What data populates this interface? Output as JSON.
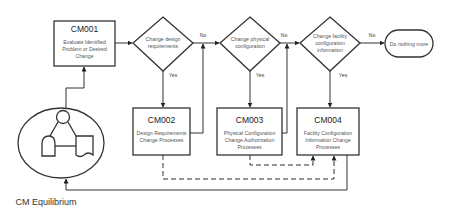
{
  "diagram": {
    "processes": [
      {
        "id": "cm001",
        "code": "CM001",
        "lines": [
          "Evaluate Identified",
          "Problem or Desired",
          "Change"
        ]
      },
      {
        "id": "cm002",
        "code": "CM002",
        "lines": [
          "Design Requirements",
          "Change Processes"
        ]
      },
      {
        "id": "cm003",
        "code": "CM003",
        "lines": [
          "Physical Configuration",
          "Change Authorization",
          "Processes"
        ]
      },
      {
        "id": "cm004",
        "code": "CM004",
        "lines": [
          "Facility Configuration",
          "Information Change",
          "Processes"
        ]
      }
    ],
    "decisions": [
      {
        "id": "d1",
        "lines": [
          "Change design",
          "requirements"
        ]
      },
      {
        "id": "d2",
        "lines": [
          "Change physical",
          "configuration"
        ]
      },
      {
        "id": "d3",
        "lines": [
          "Change facility",
          "configuration",
          "information"
        ]
      }
    ],
    "terminal": {
      "label": "Do nothing more"
    },
    "edge_labels": {
      "no": "No",
      "yes": "Yes"
    },
    "actor": {
      "caption": "CM Equilibrium",
      "icon": "user-document-icon"
    }
  }
}
